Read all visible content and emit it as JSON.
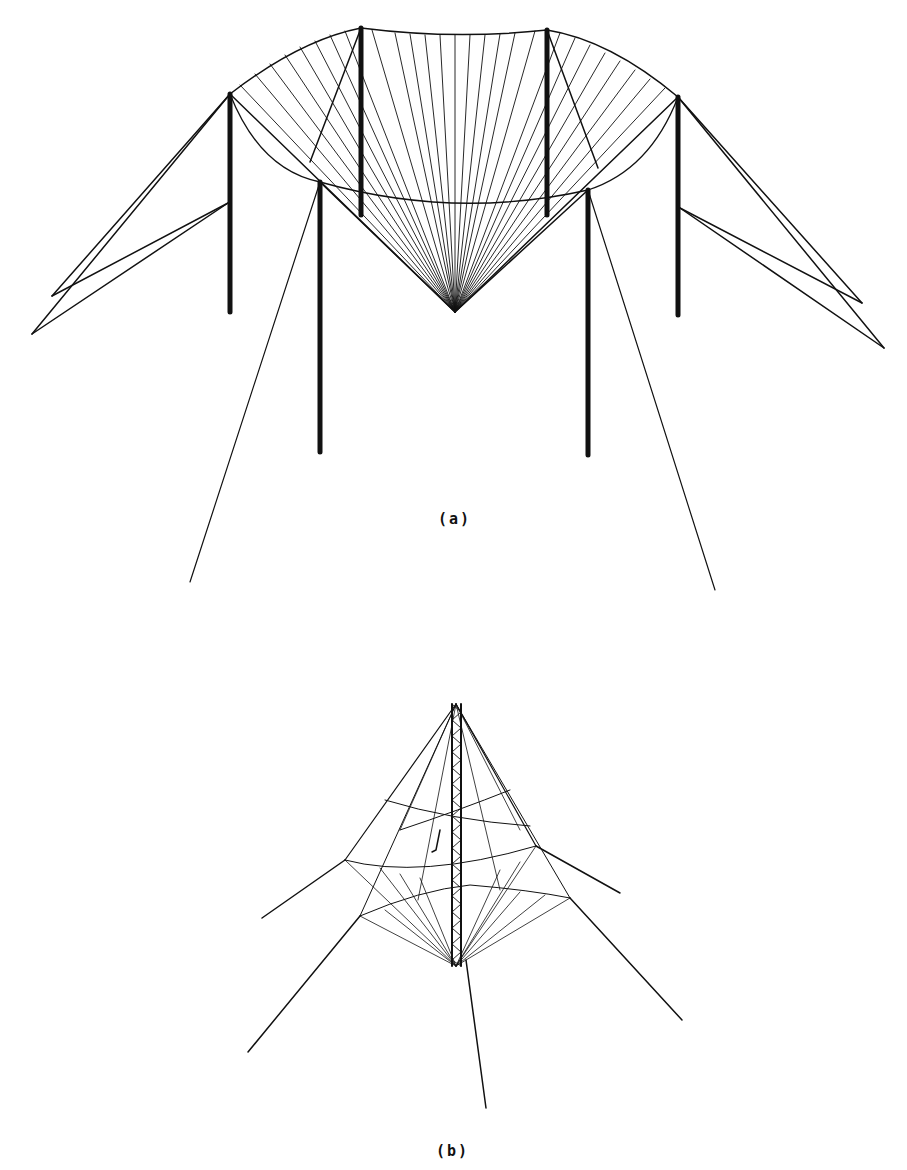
{
  "figure": {
    "panels": [
      {
        "id": "a",
        "label": "(a)",
        "description": "Six-mast suspended curtain / umbrella wire antenna, perspective view"
      },
      {
        "id": "b",
        "label": "(b)",
        "description": "Central lattice tower with radial guyed wire cage antenna, perspective view"
      }
    ],
    "colors": {
      "background": "#ffffff",
      "line": "#111111"
    }
  }
}
